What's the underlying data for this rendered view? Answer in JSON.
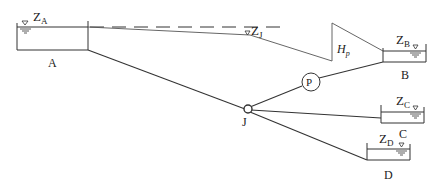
{
  "diagram": {
    "reservoirs": [
      {
        "id": "A",
        "label": "A",
        "head_label": "Z",
        "head_sub": "A"
      },
      {
        "id": "B",
        "label": "B",
        "head_label": "Z",
        "head_sub": "B"
      },
      {
        "id": "C",
        "label": "C",
        "head_label": "Z",
        "head_sub": "C"
      },
      {
        "id": "D",
        "label": "D",
        "head_label": "Z",
        "head_sub": "D"
      }
    ],
    "junction": {
      "label": "J",
      "head_label": "Z",
      "head_sub": "J"
    },
    "pump": {
      "label": "P",
      "head_label": "H",
      "head_sub": "p"
    },
    "colors": {
      "line": "#333333",
      "text": "#222222"
    }
  }
}
